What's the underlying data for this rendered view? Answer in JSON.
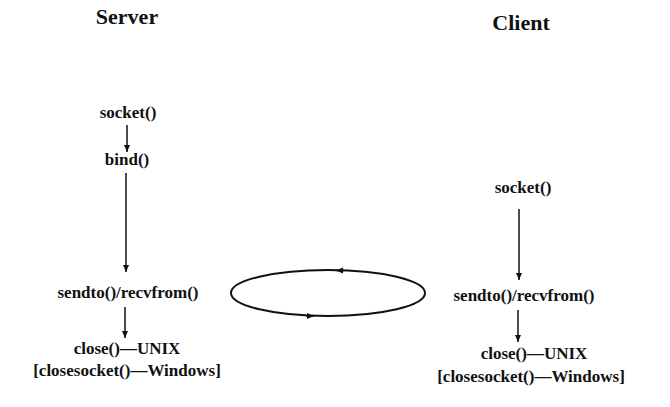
{
  "server": {
    "title": "Server",
    "steps": [
      "socket()",
      "bind()",
      "sendto()/recvfrom()",
      "close()—UNIX",
      "[closesocket()—Windows]"
    ]
  },
  "client": {
    "title": "Client",
    "steps": [
      "socket()",
      "sendto()/recvfrom()",
      "close()—UNIX",
      "[closesocket()—Windows]"
    ]
  },
  "exchange": {
    "shape": "ellipse",
    "arrows": [
      "top-leftward",
      "bottom-rightward"
    ]
  },
  "colors": {
    "ink": "#111111",
    "background": "#ffffff"
  }
}
